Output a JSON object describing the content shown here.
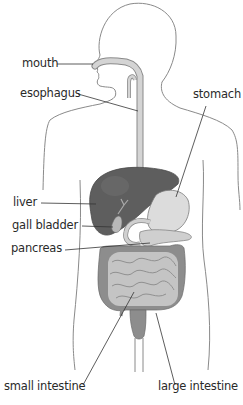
{
  "diagram": {
    "type": "anatomical-diagram",
    "colors": {
      "outline": "#8a8a8a",
      "tube_fill": "#d4d4d4",
      "liver": "#5e5e5e",
      "stomach": "#dcdcdc",
      "intestine_dark": "#8d8d8d",
      "intestine_light": "#c4c4c4",
      "leader_line": "#333333",
      "text": "#2a2a2a"
    },
    "labels": {
      "mouth": "mouth",
      "esophagus": "esophagus",
      "stomach": "stomach",
      "liver": "liver",
      "gall_bladder": "gall bladder",
      "pancreas": "pancreas",
      "small_intestine": "small intestine",
      "large_intestine": "large intestine"
    }
  }
}
